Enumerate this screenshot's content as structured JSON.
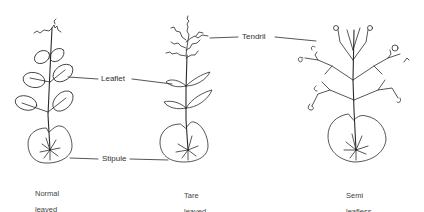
{
  "diagram": {
    "labels": {
      "leaflet": "Leaflet",
      "tendril": "Tendril",
      "stipule": "Stipule"
    },
    "plants": [
      {
        "id": "normal",
        "caption_line1": "Normal",
        "caption_line2": "leaved"
      },
      {
        "id": "tare",
        "caption_line1": "Tare",
        "caption_line2": "leaved"
      },
      {
        "id": "semi",
        "caption_line1": "Semi",
        "caption_line2": "leafless"
      }
    ],
    "colors": {
      "ink": "#2a2a2a",
      "background": "#ffffff"
    }
  }
}
